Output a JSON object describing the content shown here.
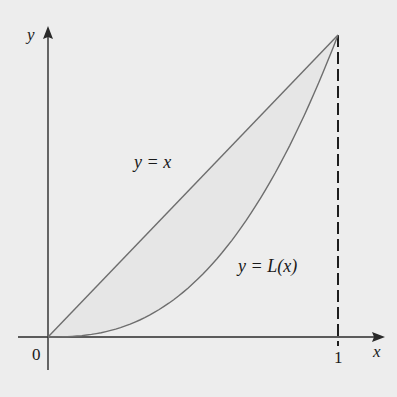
{
  "colors": {
    "background": "#ededed",
    "axis": "#2a2a2a",
    "curve": "#6e6e6e",
    "dashed": "#1e1e1e",
    "text": "#1a1a1a"
  },
  "labels": {
    "y_axis": "y",
    "x_axis": "x",
    "origin": "0",
    "x_tick_1": "1",
    "line_label": "y = x",
    "curve_label": "y = L(x)"
  },
  "chart_data": {
    "type": "line",
    "title": "",
    "xlabel": "x",
    "ylabel": "y",
    "xlim": [
      0,
      1
    ],
    "ylim": [
      0,
      1
    ],
    "x_ticks": [
      "0",
      "1"
    ],
    "grid": false,
    "legend": "none (inline annotations)",
    "series": [
      {
        "name": "y = x",
        "x": [
          0,
          0.25,
          0.5,
          0.75,
          1
        ],
        "values": [
          0,
          0.25,
          0.5,
          0.75,
          1
        ]
      },
      {
        "name": "y = L(x)",
        "x": [
          0,
          0.25,
          0.5,
          0.75,
          1
        ],
        "values": [
          0,
          0.03,
          0.18,
          0.48,
          1
        ]
      }
    ],
    "annotations": [
      {
        "text": "y = x",
        "x": 0.3,
        "y": 0.6
      },
      {
        "text": "y = L(x)",
        "x": 0.67,
        "y": 0.25
      },
      {
        "type": "dashed vertical line",
        "x": 1,
        "from": 0,
        "to": 1
      }
    ]
  }
}
